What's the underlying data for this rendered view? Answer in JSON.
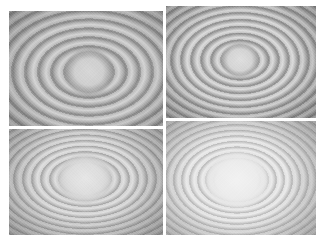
{
  "figure": {
    "layout": "2x2 grid",
    "panels": [
      {
        "position": "top-left",
        "fringe_contrast": "high",
        "ring_spacing_px": 13
      },
      {
        "position": "top-right",
        "fringe_contrast": "high",
        "ring_spacing_px": 10
      },
      {
        "position": "bottom-left",
        "fringe_contrast": "medium",
        "ring_spacing_px": 9
      },
      {
        "position": "bottom-right",
        "fringe_contrast": "low",
        "ring_spacing_px": 8
      }
    ],
    "colors": {
      "background": "#ffffff",
      "fringe_dark": "#8a8a8a",
      "fringe_light": "#dcdcdc"
    }
  }
}
